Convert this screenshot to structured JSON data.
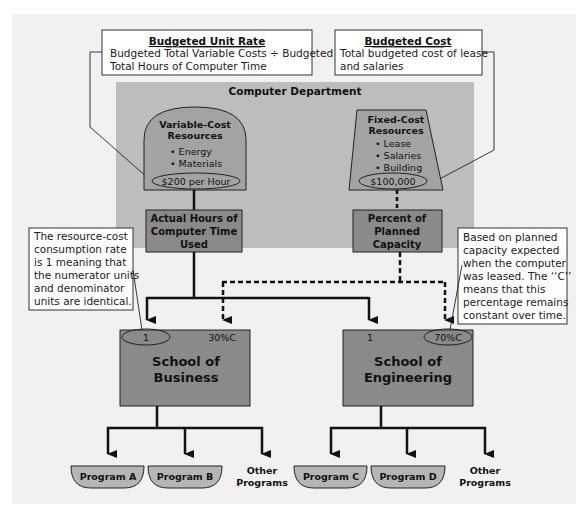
{
  "colors": {
    "page_bg": "#ffffff",
    "panel_bg": "#f1f1f1",
    "department_bg": "#bdbdbd",
    "resource_fill": "#a3a3a3",
    "box_fill": "#8a8a8a",
    "school_fill": "#8a8a8a",
    "program_fill": "#b5b5b5",
    "stroke": "#111111",
    "note_bg": "#ffffff"
  },
  "notes": {
    "budgeted_unit_rate": {
      "title": "Budgeted Unit Rate",
      "line1": "Budgeted Total Variable Costs ÷ Budgeted",
      "line2": "Total Hours of Computer Time"
    },
    "budgeted_cost": {
      "title": "Budgeted Cost",
      "line1": "Total budgeted cost of lease",
      "line2": "and salaries"
    },
    "consumption_rate": {
      "lines": [
        "The resource-cost",
        "consumption rate",
        "is 1 meaning that",
        "the numerator units",
        "and denominator",
        "units are identical."
      ]
    },
    "planned_capacity": {
      "lines": [
        "Based on planned",
        "capacity expected",
        "when the computer",
        "was leased. The ‘‘C’’",
        "means that this",
        "percentage remains",
        "constant over time."
      ]
    }
  },
  "department": {
    "title": "Computer Department",
    "variable_cost": {
      "title_line1": "Variable-Cost",
      "title_line2": "Resources",
      "items": [
        "• Energy",
        "• Materials"
      ],
      "rate": "$200 per Hour"
    },
    "fixed_cost": {
      "title_line1": "Fixed-Cost",
      "title_line2": "Resources",
      "items": [
        "• Lease",
        "• Salaries",
        "• Building"
      ],
      "amount": "$100,000"
    },
    "actual_hours": {
      "lines": [
        "Actual Hours of",
        "Computer Time",
        "Used"
      ]
    },
    "percent_capacity": {
      "lines": [
        "Percent of",
        "Planned",
        "Capacity"
      ]
    }
  },
  "schools": {
    "business": {
      "line1": "School of",
      "line2": "Business",
      "variable_rate": "1",
      "fixed_share": "30%C",
      "programs": [
        "Program A",
        "Program B"
      ],
      "other_line1": "Other",
      "other_line2": "Programs"
    },
    "engineering": {
      "line1": "School of",
      "line2": "Engineering",
      "variable_rate": "1",
      "fixed_share": "70%C",
      "programs": [
        "Program C",
        "Program D"
      ],
      "other_line1": "Other",
      "other_line2": "Programs"
    }
  }
}
